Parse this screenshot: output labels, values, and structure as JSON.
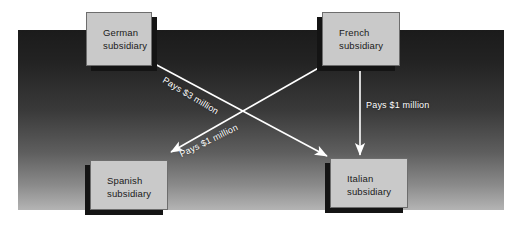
{
  "diagram": {
    "background_color": "#2b2b2b",
    "node_fill_color": "#c9c9c9",
    "arrow_color": "#ffffff",
    "nodes": [
      {
        "id": "german",
        "line1": "German",
        "line2": "subsidiary"
      },
      {
        "id": "french",
        "line1": "French",
        "line2": "subsidiary"
      },
      {
        "id": "spanish",
        "line1": "Spanish",
        "line2": "subsidiary"
      },
      {
        "id": "italian",
        "line1": "Italian",
        "line2": "subsidiary"
      }
    ],
    "edges": [
      {
        "id": "german-italian",
        "from": "German subsidiary",
        "to": "Italian subsidiary",
        "label": "Pays $3 million",
        "amount": "$3 million"
      },
      {
        "id": "french-spanish",
        "from": "French subsidiary",
        "to": "Spanish subsidiary",
        "label": "Pays $1 million",
        "amount": "$1 million"
      },
      {
        "id": "french-italian",
        "from": "French subsidiary",
        "to": "Italian subsidiary",
        "label": "Pays $1 million",
        "amount": "$1 million"
      }
    ]
  }
}
